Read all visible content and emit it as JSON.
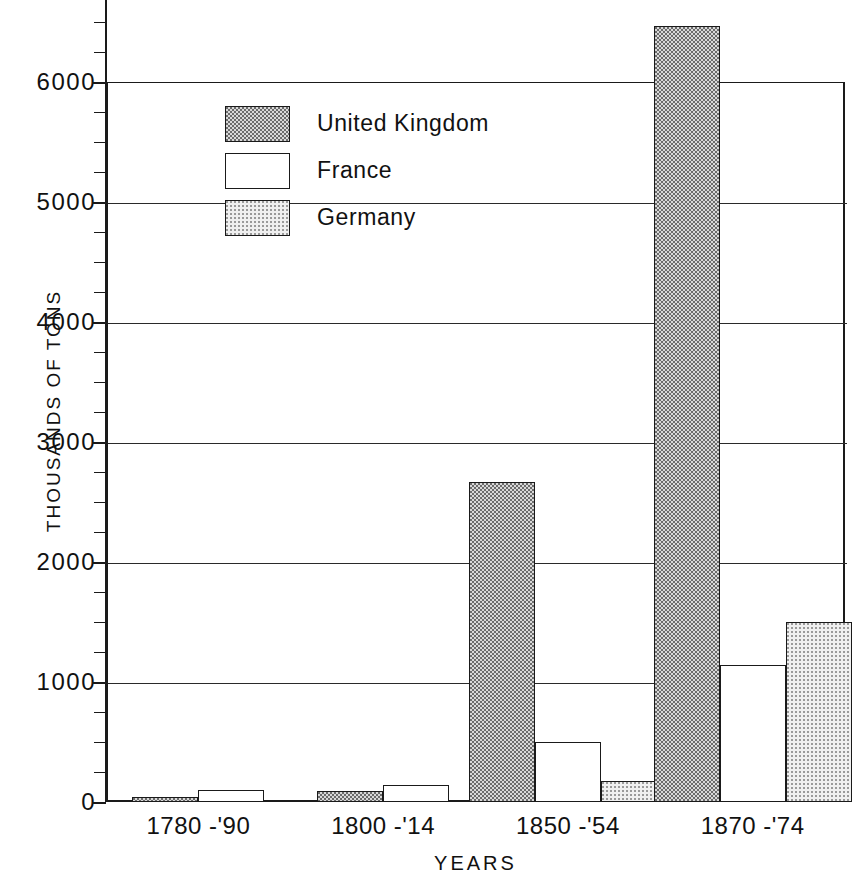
{
  "chart_data": {
    "type": "bar",
    "title": "",
    "xlabel": "YEARS",
    "ylabel": "THOUSANDS OF TONS",
    "categories": [
      "1780 -'90",
      "1800 -'14",
      "1850 -'54",
      "1870 -'74"
    ],
    "series": [
      {
        "name": "United Kingdom",
        "values": [
          40,
          90,
          2670,
          6470
        ],
        "fill": "dark-stipple"
      },
      {
        "name": "France",
        "values": [
          100,
          140,
          500,
          1140
        ],
        "fill": "white"
      },
      {
        "name": "Germany",
        "values": [
          null,
          null,
          175,
          1500
        ],
        "fill": "light-stipple"
      }
    ],
    "ylim": [
      0,
      6000
    ],
    "y_major_ticks": [
      0,
      1000,
      2000,
      3000,
      4000,
      5000,
      6000
    ],
    "y_tick_labels": [
      "0",
      "1000",
      "2000",
      "3000",
      "4000",
      "5000",
      "6000"
    ],
    "y_minor_tick_interval": 250,
    "grid": "horizontal",
    "legend_position": "upper-left-inside",
    "axis_note": "y axis extends above 6000 with unlabeled ticks; tallest UK bar exceeds the 6000 frame"
  },
  "legend": {
    "entries": [
      {
        "label": "United Kingdom",
        "swatch": "dark-stipple-swatch"
      },
      {
        "label": "France",
        "swatch": "white-swatch"
      },
      {
        "label": "Germany",
        "swatch": "light-stipple-swatch"
      }
    ]
  },
  "axes": {
    "y_title": "THOUSANDS OF TONS",
    "x_title": "YEARS"
  },
  "colors": {
    "ink": "#1a1a1a",
    "paper": "#ffffff",
    "uk_fill": "#d8d8d8",
    "france_fill": "#ffffff",
    "germany_fill": "#f0f0f0"
  }
}
